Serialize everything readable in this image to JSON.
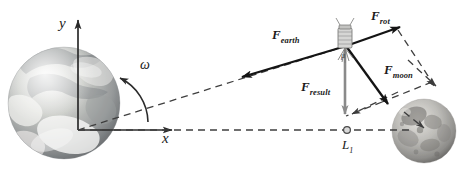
{
  "figure": {
    "width": 462,
    "height": 195,
    "background": "#ffffff"
  },
  "axes": {
    "y_label": "y",
    "x_label": "x",
    "origin_note": "Earth center",
    "color": "#2b2b2b"
  },
  "rotation": {
    "label": "ω",
    "description": "angular velocity arc arrow"
  },
  "bodies": {
    "earth": {
      "name": "Earth",
      "label": ""
    },
    "moon": {
      "name": "Moon",
      "label": ""
    },
    "spacecraft": {
      "name": "spacecraft",
      "label": "μ"
    }
  },
  "points": {
    "lagrange": {
      "label": "L",
      "sub": "1"
    }
  },
  "vectors": [
    {
      "id": "f_earth",
      "base": "F",
      "sub": "earth",
      "color": "#1a1a1a",
      "style": "solid"
    },
    {
      "id": "f_rot",
      "base": "F",
      "sub": "rot",
      "color": "#1a1a1a",
      "style": "solid"
    },
    {
      "id": "f_moon",
      "base": "F",
      "sub": "moon",
      "color": "#1a1a1a",
      "style": "solid"
    },
    {
      "id": "f_result",
      "base": "F",
      "sub": "result",
      "color": "#8a8a8a",
      "style": "solid"
    }
  ],
  "guides": {
    "earth_moon_axis": "dashed",
    "earth_to_spacecraft": "dashed",
    "parallelogram": "dashed",
    "color": "#4a4a4a"
  }
}
